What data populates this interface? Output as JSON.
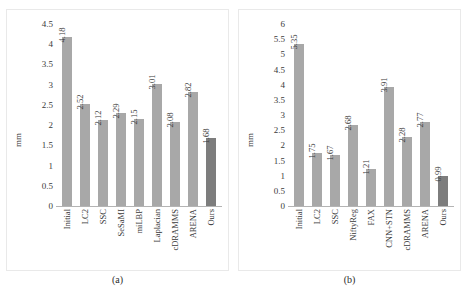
{
  "figure": {
    "panels": [
      {
        "id": "a",
        "subcaption": "(a)"
      },
      {
        "id": "b",
        "subcaption": "(b)"
      }
    ],
    "footer_note": ""
  },
  "chart_data": [
    {
      "type": "bar",
      "panel_label": "(a)",
      "title": "",
      "xlabel": "",
      "ylabel": "mm",
      "ylim": [
        0,
        4.5
      ],
      "ytick_step": 0.5,
      "yticks": [
        "4.5",
        "4",
        "3.5",
        "3",
        "2.5",
        "2",
        "1.5",
        "1",
        "0.5",
        "0"
      ],
      "grid": false,
      "legend": "none",
      "categories": [
        "Initial",
        "LC2",
        "SSC",
        "SeSaMI",
        "miLBP",
        "Laplacian",
        "cDRAMMS",
        "ARENA",
        "Ours"
      ],
      "values": [
        4.18,
        2.52,
        2.12,
        2.29,
        2.15,
        3.01,
        2.08,
        2.82,
        1.68
      ],
      "value_labels": [
        "4.18",
        "2.52",
        "2.12",
        "2.29",
        "2.15",
        "3.01",
        "2.08",
        "2.82",
        "1.68"
      ],
      "highlight_index": 8,
      "bar_color": "#a8a8a8",
      "highlight_color": "#7d7d7d"
    },
    {
      "type": "bar",
      "panel_label": "(b)",
      "title": "",
      "xlabel": "",
      "ylabel": "mm",
      "ylim": [
        0,
        6
      ],
      "ytick_step": 0.5,
      "yticks": [
        "6",
        "5.5",
        "5",
        "4.5",
        "4",
        "3.5",
        "3",
        "2.5",
        "2",
        "1.5",
        "1",
        "0.5",
        "0"
      ],
      "grid": false,
      "legend": "none",
      "categories": [
        "Initial",
        "LC2",
        "SSC",
        "NiftyReg",
        "FAX",
        "CNN+STN",
        "cDRAMMS",
        "ARENA",
        "Ours"
      ],
      "values": [
        5.35,
        1.75,
        1.67,
        2.68,
        1.21,
        3.91,
        2.28,
        2.77,
        0.99
      ],
      "value_labels": [
        "5.35",
        "1.75",
        "1.67",
        "2.68",
        "1.21",
        "3.91",
        "2.28",
        "2.77",
        "0.99"
      ],
      "highlight_index": 8,
      "bar_color": "#a8a8a8",
      "highlight_color": "#7d7d7d"
    }
  ]
}
